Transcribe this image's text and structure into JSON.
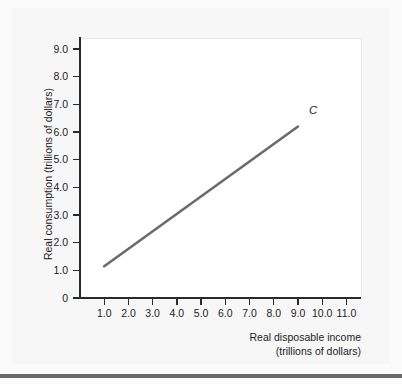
{
  "chart_data": {
    "type": "line",
    "title": "",
    "xlabel": "Real disposable income",
    "xlabel_line2": "(trillions of dollars)",
    "ylabel": "Real consumption (trillions of dollars)",
    "xlim": [
      0,
      11.6
    ],
    "ylim": [
      0,
      9.4
    ],
    "grid": false,
    "legend_position": "none",
    "xticks": [
      "1.0",
      "2.0",
      "3.0",
      "4.0",
      "5.0",
      "6.0",
      "7.0",
      "8.0",
      "9.0",
      "10.0",
      "11.0"
    ],
    "xtick_values": [
      1.0,
      2.0,
      3.0,
      4.0,
      5.0,
      6.0,
      7.0,
      8.0,
      9.0,
      10.0,
      11.0
    ],
    "yticks": [
      "0",
      "1.0",
      "2.0",
      "3.0",
      "4.0",
      "5.0",
      "6.0",
      "7.0",
      "8.0",
      "9.0"
    ],
    "ytick_values": [
      0,
      1.0,
      2.0,
      3.0,
      4.0,
      5.0,
      6.0,
      7.0,
      8.0,
      9.0
    ],
    "series": [
      {
        "name": "C",
        "label": "C",
        "color": "#6b6b6b",
        "x": [
          1.0,
          9.0
        ],
        "values": [
          1.15,
          6.2
        ]
      }
    ],
    "annotations": [
      {
        "text": "C",
        "x": 9.45,
        "y": 6.75,
        "style": "italic"
      }
    ]
  },
  "colors": {
    "line": "#6b6b6b",
    "axis": "#2a2a2a",
    "text": "#1c1c1c",
    "panel": "#f7f7f7",
    "plot_background": "#ffffff",
    "page_background": "#fbfbfb",
    "bottom_bar": "#6a6a6a"
  }
}
